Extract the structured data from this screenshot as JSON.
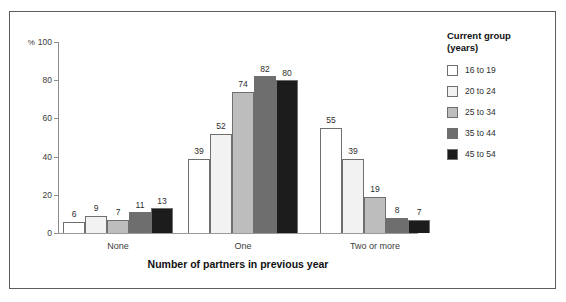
{
  "chart_data": {
    "type": "bar",
    "title": "",
    "xlabel": "Number of partners in previous year",
    "ylabel": "%",
    "y_unit_prefix": "%",
    "ylim": [
      0,
      100
    ],
    "yticks": [
      0,
      20,
      40,
      60,
      80,
      100
    ],
    "ytick_labels": [
      "0",
      "20",
      "40",
      "60",
      "80",
      "100"
    ],
    "grid": false,
    "legend_position": "right",
    "categories": [
      "None",
      "One",
      "Two or more"
    ],
    "series": [
      {
        "name": "16 to 19",
        "color": "#ffffff",
        "values": [
          6,
          39,
          55
        ]
      },
      {
        "name": "20 to 24",
        "color": "#f2f2f2",
        "values": [
          9,
          52,
          39
        ]
      },
      {
        "name": "25 to 34",
        "color": "#bdbdbd",
        "values": [
          7,
          74,
          19
        ]
      },
      {
        "name": "35 to 44",
        "color": "#6e6e6e",
        "values": [
          11,
          82,
          8
        ]
      },
      {
        "name": "45 to 54",
        "color": "#1c1c1c",
        "values": [
          13,
          80,
          7
        ]
      }
    ]
  },
  "legend": {
    "title": "Current group\n(years)"
  }
}
